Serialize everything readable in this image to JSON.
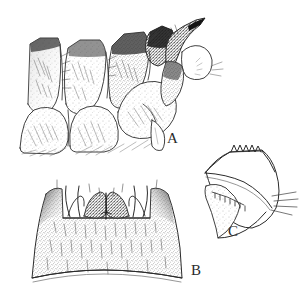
{
  "figure": {
    "background_color": "#ffffff",
    "ink_color": "#2b2b2b",
    "width": 308,
    "height": 306,
    "technique": "stipple-and-line ink drawing",
    "panel_count": 3
  },
  "labels": {
    "a": "A",
    "b": "B",
    "c": "C"
  },
  "panels": [
    {
      "id": "A",
      "label": "A",
      "name": "lateral-abdominal-segments",
      "description": "Lateral view of overlapping abdominal segments with pointed terminal process",
      "label_position": {
        "x": 167,
        "y": 131
      },
      "bounds": {
        "x": 18,
        "y": 14,
        "width": 200,
        "height": 140
      },
      "features": [
        "stippled segment plates",
        "dark shaded dorsal margin",
        "pointed apical spine",
        "setae tufts",
        "small ventral appendage",
        "hatched shading"
      ]
    },
    {
      "id": "B",
      "label": "B",
      "name": "ventral-plate",
      "description": "Trapezoidal sclerite plate with median notch and paired dark lobes on upper margin",
      "label_position": {
        "x": 191,
        "y": 263
      },
      "bounds": {
        "x": 26,
        "y": 178,
        "width": 160,
        "height": 110
      },
      "features": [
        "dark anterolateral corners",
        "paired dark stippled lobes",
        "median V-notch",
        "curved lateral setae",
        "dense stippling with scattered setae",
        "concave posterior margin"
      ]
    },
    {
      "id": "C",
      "label": "C",
      "name": "hook-process",
      "description": "Curved hook-shaped process with serrate apical crown and toothed inner ridge",
      "label_position": {
        "x": 228,
        "y": 224
      },
      "bounds": {
        "x": 200,
        "y": 144,
        "width": 100,
        "height": 95
      },
      "features": [
        "serrate crown with five teeth",
        "curved outer margin",
        "row of small inner teeth",
        "radiating setae at right margin",
        "pointed basal lobe"
      ]
    }
  ],
  "colors": {
    "ink": "#2b2b2b",
    "mid_tone": "#6e6e6e",
    "light_tone": "#b6b6b6",
    "dark_tone": "#1a1a1a",
    "background": "#ffffff"
  }
}
